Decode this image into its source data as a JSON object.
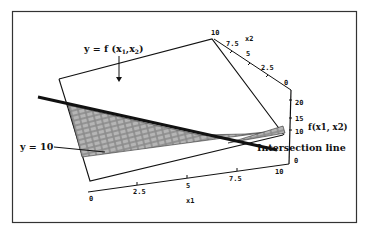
{
  "figure": {
    "title": "",
    "frame_color": "#333333",
    "line_color": "#111111",
    "hatch_color": "#555555"
  },
  "annotations": {
    "surface_label": "y = f (x",
    "surface_sub1": "1",
    "surface_mid": ",x",
    "surface_sub2": "2",
    "surface_close": ")",
    "plane_label": "y = 10",
    "intersection_label": "Intersection line"
  },
  "axes": {
    "x1": {
      "label": "x1",
      "ticks": [
        "0",
        "2.5",
        "5",
        "7.5",
        "10"
      ]
    },
    "x2": {
      "label": "x2",
      "ticks": [
        "10",
        "7.5",
        "5",
        "2.5",
        "0"
      ]
    },
    "z": {
      "label": "f(x1,  x2)",
      "ticks": [
        "20",
        "15",
        "10",
        "0"
      ]
    }
  }
}
